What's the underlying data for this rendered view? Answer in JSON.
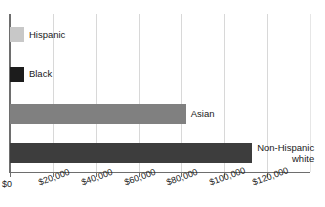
{
  "chart_data": {
    "type": "bar",
    "orientation": "horizontal",
    "title": "",
    "xlabel": "",
    "ylabel": "",
    "categories": [
      "Hispanic",
      "Black",
      "Asian",
      "Non-Hispanic white"
    ],
    "values": [
      6500,
      6500,
      82000,
      113000
    ],
    "xlim": [
      0,
      140000
    ],
    "xticks": [
      0,
      20000,
      40000,
      60000,
      80000,
      100000,
      120000
    ],
    "xticklabels": [
      "$0",
      "$20,000",
      "$40,000",
      "$60,000",
      "$80,000",
      "$100,000",
      "$120,000"
    ],
    "grid": "vertical",
    "legend": "none",
    "bar_colors": [
      "#c8c8c8",
      "#1c1c1c",
      "#808080",
      "#3d3d3d"
    ],
    "label_position": "outside-end"
  },
  "axis": {
    "ticks": [
      {
        "label": "$0"
      },
      {
        "label": "$20,000"
      },
      {
        "label": "$40,000"
      },
      {
        "label": "$60,000"
      },
      {
        "label": "$80,000"
      },
      {
        "label": "$100,000"
      },
      {
        "label": "$120,000"
      }
    ]
  },
  "bars": [
    {
      "label": "Hispanic",
      "label_line2": "",
      "value": 6500,
      "color": "#c8c8c8"
    },
    {
      "label": "Black",
      "label_line2": "",
      "value": 6500,
      "color": "#1c1c1c"
    },
    {
      "label": "Asian",
      "label_line2": "",
      "value": 82000,
      "color": "#808080"
    },
    {
      "label": "Non-Hispanic",
      "label_line2": "white",
      "value": 113000,
      "color": "#3d3d3d"
    }
  ],
  "colors": {
    "grid": "#d8d8d8",
    "axis": "#6e6e6e",
    "text": "#1a1a1a",
    "background": "#ffffff"
  },
  "source_note": ""
}
